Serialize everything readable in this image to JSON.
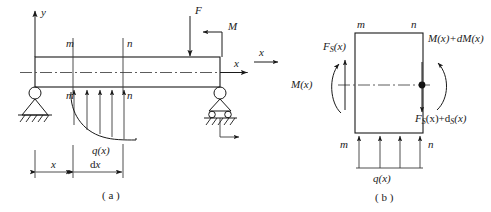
{
  "figure": {
    "title_a": "( a )",
    "title_b": "( b )",
    "axes": {
      "y_label": "y",
      "x_label": "x",
      "x_label_b": "x"
    },
    "panel_a": {
      "loads": {
        "point_force": "F",
        "moment": "M",
        "distributed": "q(x)"
      },
      "section_labels": {
        "m_top": "m",
        "n_top": "n",
        "m_bottom": "m",
        "n_bottom": "n"
      },
      "dimensions": {
        "x": "x",
        "dx": "dx"
      },
      "supports": {
        "left": "pin-support",
        "right": "roller-support"
      },
      "distributed_arrow_count": 5
    },
    "panel_b": {
      "section_labels": {
        "m_top": "m",
        "n_top": "n",
        "m_bottom": "m",
        "n_bottom": "n"
      },
      "forces": {
        "shear_left": "F",
        "shear_left_sub": "S",
        "shear_left_arg": "(x)",
        "moment_left": "M(x)",
        "moment_right": "M(x)+dM(x)",
        "shear_right": "F",
        "shear_right_sub": "S",
        "shear_right_mid": "(x)+d",
        "shear_right_sub2": "S",
        "shear_right_end": "(x)",
        "distributed": "q(x)"
      },
      "distributed_arrow_count": 4
    },
    "colors": {
      "line": "#1a1a1a",
      "centerline": "#4a4a4a",
      "background": "#ffffff"
    }
  }
}
